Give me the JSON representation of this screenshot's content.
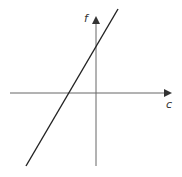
{
  "diagram": {
    "type": "linear-graph",
    "axes": {
      "x_label": "c",
      "y_label": "f"
    },
    "line": {
      "description": "straight line with positive slope, positive y-intercept, negative x-intercept"
    },
    "colors": {
      "axis": "#666666",
      "line": "#222222"
    }
  }
}
